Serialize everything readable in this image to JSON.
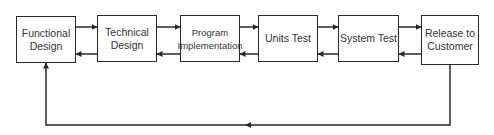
{
  "diagram": {
    "stages": [
      {
        "id": "functional-design",
        "label": "Functional\nDesign"
      },
      {
        "id": "technical-design",
        "label": "Technical\nDesign"
      },
      {
        "id": "program-implementation",
        "label": "Program\nImplementation"
      },
      {
        "id": "units-test",
        "label": "Units Test"
      },
      {
        "id": "system-test",
        "label": "System Test"
      },
      {
        "id": "release-to-customer",
        "label": "Release to\nCustomer"
      }
    ],
    "edges": [
      {
        "from": "functional-design",
        "to": "technical-design",
        "direction": "forward"
      },
      {
        "from": "technical-design",
        "to": "functional-design",
        "direction": "back"
      },
      {
        "from": "technical-design",
        "to": "program-implementation",
        "direction": "forward"
      },
      {
        "from": "program-implementation",
        "to": "technical-design",
        "direction": "back"
      },
      {
        "from": "program-implementation",
        "to": "units-test",
        "direction": "forward"
      },
      {
        "from": "units-test",
        "to": "program-implementation",
        "direction": "back"
      },
      {
        "from": "units-test",
        "to": "system-test",
        "direction": "forward"
      },
      {
        "from": "system-test",
        "to": "units-test",
        "direction": "back"
      },
      {
        "from": "system-test",
        "to": "release-to-customer",
        "direction": "forward"
      },
      {
        "from": "release-to-customer",
        "to": "system-test",
        "direction": "back"
      },
      {
        "from": "release-to-customer",
        "to": "functional-design",
        "direction": "feedback-loop"
      }
    ],
    "colors": {
      "stroke": "#2a2a2a",
      "text": "#333333",
      "background": "#ffffff"
    }
  }
}
